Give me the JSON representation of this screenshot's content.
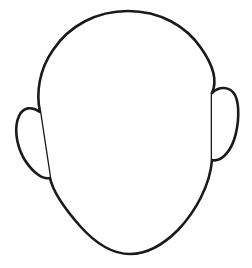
{
  "page": {
    "title": "Blank Face Outline",
    "background_color": "#ffffff",
    "width": 252,
    "height": 268
  },
  "drawing": {
    "name": "blank-face-outline",
    "description": "Blank featureless face outline template",
    "style": "line-art",
    "stroke_color": "#1a1a1a",
    "fill_color": "#ffffff",
    "stroke_width": 2.6,
    "parts": [
      {
        "name": "head",
        "label": "Head outline",
        "path": "M 128 11 C 160 11 186 26 201 48 C 213 65 218 80 212 93 L 212 160 C 210 185 196 211 178 230 C 162 246 145 254 130 254 C 114 254 96 244 80 226 C 65 209 53 192 50 178 L 40 112 C 36 93 39 70 53 50 C 69 26 96 11 128 11 Z"
      },
      {
        "name": "left-ear",
        "label": "Left ear",
        "path": "M 40 112 C 32 106 23 107 19 116 C 14 127 16 143 23 157 C 31 171 42 180 50 178"
      },
      {
        "name": "right-ear",
        "label": "Right ear",
        "path": "M 212 93 C 219 86 230 86 235 95 C 240 105 239 125 234 140 C 229 154 220 162 212 160"
      }
    ],
    "anchors": {
      "head_apex": [
        128,
        11
      ],
      "chin_bottom": [
        130,
        254
      ],
      "left_widest": [
        38,
        112
      ],
      "right_widest": [
        212,
        95
      ],
      "left_ear_outer": [
        18,
        136
      ],
      "right_ear_outer": [
        238,
        118
      ]
    }
  }
}
